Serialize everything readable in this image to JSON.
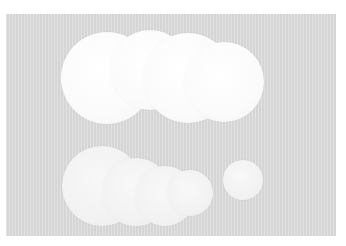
{
  "image": {
    "description": "Photo of white circular paper disks arranged in two rows on a light gray textured surface",
    "colors": {
      "background": "#ffffff",
      "surface": "#dcdcdc",
      "disk": "#fbfbfb"
    },
    "disks": [
      {
        "x": 107,
        "y": 78,
        "r": 46,
        "tone": "bright"
      },
      {
        "x": 150,
        "y": 70,
        "r": 40,
        "tone": "bright"
      },
      {
        "x": 188,
        "y": 78,
        "r": 45,
        "tone": "bright"
      },
      {
        "x": 224,
        "y": 82,
        "r": 40,
        "tone": "bright"
      },
      {
        "x": 102,
        "y": 186,
        "r": 40,
        "tone": "dim"
      },
      {
        "x": 136,
        "y": 192,
        "r": 34,
        "tone": "dim"
      },
      {
        "x": 165,
        "y": 196,
        "r": 30,
        "tone": "dim"
      },
      {
        "x": 190,
        "y": 193,
        "r": 23,
        "tone": "dim"
      },
      {
        "x": 243,
        "y": 180,
        "r": 20,
        "tone": "dim"
      }
    ]
  }
}
